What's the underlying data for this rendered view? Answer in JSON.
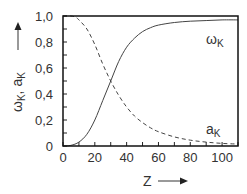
{
  "chart_data": {
    "type": "line",
    "title": "",
    "xlabel": "Z",
    "ylabel": "ωK, aK",
    "xlim": [
      0,
      110
    ],
    "ylim": [
      0,
      1.0
    ],
    "x_ticks": [
      0,
      20,
      40,
      60,
      80,
      100
    ],
    "x_tick_labels": [
      "0",
      "20",
      "40",
      "60",
      "80",
      "100"
    ],
    "x_minor_step": 10,
    "y_ticks": [
      0,
      0.2,
      0.4,
      0.6,
      0.8,
      1.0
    ],
    "y_tick_labels": [
      "0",
      "0,2",
      "0,4",
      "0,6",
      "0,8",
      "1,0"
    ],
    "y_minor_step": 0.1,
    "grid": false,
    "legend": "inline labels",
    "series": [
      {
        "name": "ωK",
        "style": "solid",
        "x": [
          0,
          5,
          10,
          15,
          20,
          25,
          30,
          35,
          40,
          45,
          50,
          55,
          60,
          70,
          80,
          90,
          100,
          110
        ],
        "values": [
          0.0,
          0.005,
          0.03,
          0.09,
          0.2,
          0.35,
          0.5,
          0.65,
          0.76,
          0.83,
          0.88,
          0.91,
          0.93,
          0.95,
          0.96,
          0.965,
          0.97,
          0.97
        ],
        "label_pos": [
          92,
          0.82
        ]
      },
      {
        "name": "aK",
        "style": "dashed",
        "x": [
          0,
          5,
          8,
          10,
          15,
          20,
          25,
          30,
          35,
          40,
          45,
          50,
          55,
          60,
          70,
          80,
          90,
          100,
          110
        ],
        "values": [
          1.0,
          1.0,
          0.99,
          0.97,
          0.9,
          0.78,
          0.63,
          0.5,
          0.39,
          0.3,
          0.23,
          0.18,
          0.14,
          0.11,
          0.07,
          0.045,
          0.03,
          0.02,
          0.015
        ],
        "label_pos": [
          96,
          0.12
        ]
      }
    ]
  },
  "labels": {
    "y_axis": {
      "omega": "ω",
      "omega_sub": "K",
      "sep": ", ",
      "a": "a",
      "a_sub": "K"
    },
    "x_axis": "Z",
    "omega_series": {
      "main": "ω",
      "sub": "K"
    },
    "a_series": {
      "main": "a",
      "sub": "K"
    }
  }
}
